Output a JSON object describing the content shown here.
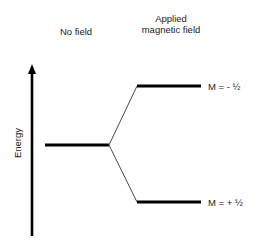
{
  "headers": {
    "no_field": "No field",
    "applied_field_line1": "Applied",
    "applied_field_line2": "magnetic field"
  },
  "axis": {
    "label": "Energy",
    "direction": "up"
  },
  "levels": {
    "ground": {
      "state": "degenerate",
      "label": ""
    },
    "upper": {
      "label": "M = - ½"
    },
    "lower": {
      "label": "M = + ½"
    }
  },
  "colors": {
    "line": "#000000",
    "text": "#222222",
    "background": "#ffffff"
  }
}
